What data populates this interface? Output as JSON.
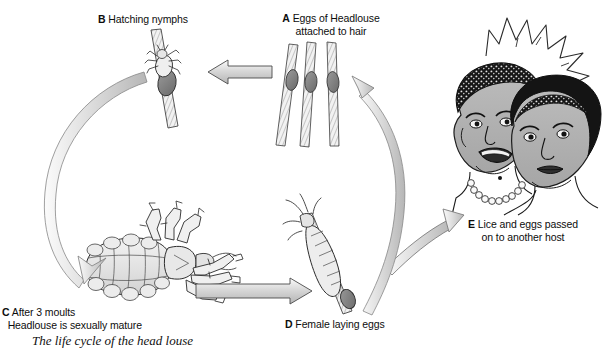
{
  "figure": {
    "caption": "The life cycle of the head louse",
    "background_color": "#ffffff",
    "ink_color": "#111111",
    "fill_light": "#e9e9e9",
    "fill_mid": "#b9b9b9",
    "fill_dark": "#6f6f6f",
    "width": 606,
    "height": 358
  },
  "stages": {
    "a": {
      "key": "A",
      "line1": "Eggs of Headlouse",
      "line2": "attached to hair",
      "illustration": "three-hair-shafts-with-eggs"
    },
    "b": {
      "key": "B",
      "line1": "Hatching nymphs",
      "line2": "",
      "illustration": "nymph-emerging-from-egg-on-hair"
    },
    "c": {
      "key": "C",
      "line1": "After 3 moults",
      "line2": "Headlouse is sexually mature",
      "illustration": "adult-head-louse"
    },
    "d": {
      "key": "D",
      "line1": "Female laying eggs",
      "line2": "",
      "illustration": "louse-laying-egg-on-hair"
    },
    "e": {
      "key": "E",
      "line1": "Lice and eggs passed",
      "line2": "on to another host",
      "illustration": "two-heads-touching-with-starburst"
    }
  },
  "arrows": [
    {
      "name": "arrow-a-to-b",
      "direction": "left",
      "from": "A",
      "to": "B",
      "shape": "straight"
    },
    {
      "name": "arrow-b-to-c",
      "direction": "down-left",
      "from": "B",
      "to": "C",
      "shape": "curved"
    },
    {
      "name": "arrow-c-to-d",
      "direction": "right",
      "from": "C",
      "to": "D",
      "shape": "straight"
    },
    {
      "name": "arrow-d-to-e",
      "direction": "up-right",
      "from": "D",
      "to": "E",
      "shape": "curved"
    },
    {
      "name": "arrow-e-to-a",
      "direction": "up-left",
      "from": "E",
      "to": "A",
      "shape": "curved"
    }
  ]
}
